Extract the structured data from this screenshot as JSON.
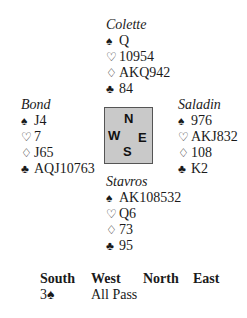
{
  "hands": {
    "north": {
      "name": "Colette",
      "spades": "Q",
      "hearts": "10954",
      "diamonds": "AKQ942",
      "clubs": "84"
    },
    "west": {
      "name": "Bond",
      "spades": "J4",
      "hearts": "7",
      "diamonds": "J65",
      "clubs": "AQJ10763"
    },
    "east": {
      "name": "Saladin",
      "spades": "976",
      "hearts": "AKJ832",
      "diamonds": "108",
      "clubs": "K2"
    },
    "south": {
      "name": "Stavros",
      "spades": "AK108532",
      "hearts": "Q6",
      "diamonds": "73",
      "clubs": "95"
    }
  },
  "suit_icons": {
    "spades": "♠",
    "hearts": "♡",
    "diamonds": "♢",
    "clubs": "♣"
  },
  "compass": {
    "n": "N",
    "w": "W",
    "e": "E",
    "s": "S",
    "fill": "#c9c9c9"
  },
  "bidding": {
    "headers": [
      "South",
      "West",
      "North",
      "East"
    ],
    "rows": [
      [
        "3♠",
        "All Pass",
        "",
        ""
      ]
    ]
  }
}
